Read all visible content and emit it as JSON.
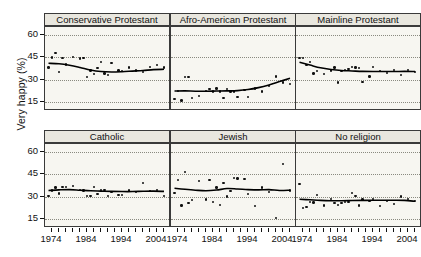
{
  "chart_data": {
    "type": "scatter",
    "title": "",
    "xlabel": "",
    "ylabel": "Very happy (%)",
    "xlim": [
      1972,
      2008
    ],
    "ylim": [
      9,
      65
    ],
    "yticks": [
      60,
      45,
      30,
      15
    ],
    "xticks_labeled": [
      1974,
      1984,
      1994,
      2004
    ],
    "xtick_step": 2,
    "grid": "horizontal dotted at y ticks",
    "legend": "none",
    "layout": {
      "rows": 2,
      "cols": 3,
      "strip_position": "top"
    },
    "panels": [
      {
        "label": "Conservative Protestant",
        "row": 0,
        "col": 0,
        "x": [
          1973,
          1974,
          1975,
          1976,
          1977,
          1978,
          1980,
          1982,
          1983,
          1984,
          1985,
          1986,
          1987,
          1988,
          1989,
          1990,
          1991,
          1993,
          1994,
          1996,
          1998,
          2000,
          2002,
          2004,
          2006
        ],
        "y": [
          38.0,
          44.8,
          47.5,
          35.0,
          44.2,
          40.0,
          45.0,
          44.0,
          44.5,
          31.5,
          36.0,
          33.5,
          37.5,
          41.5,
          34.0,
          33.0,
          41.0,
          36.0,
          35.5,
          38.0,
          36.0,
          35.0,
          38.5,
          39.5,
          38.0
        ],
        "smooth": [
          [
            1973,
            40.8
          ],
          [
            1976,
            40.5
          ],
          [
            1979,
            39.5
          ],
          [
            1982,
            38.0
          ],
          [
            1985,
            36.3
          ],
          [
            1988,
            35.3
          ],
          [
            1991,
            35.0
          ],
          [
            1994,
            35.2
          ],
          [
            1997,
            35.6
          ],
          [
            2000,
            36.0
          ],
          [
            2003,
            36.6
          ],
          [
            2006,
            36.8
          ]
        ]
      },
      {
        "label": "Afro-American Protestant",
        "row": 0,
        "col": 1,
        "x": [
          1973,
          1974,
          1975,
          1976,
          1977,
          1978,
          1980,
          1982,
          1983,
          1984,
          1985,
          1986,
          1987,
          1988,
          1989,
          1990,
          1991,
          1993,
          1994,
          1996,
          1998,
          2000,
          2002,
          2004,
          2006
        ],
        "y": [
          17.0,
          22.5,
          16.0,
          31.5,
          31.5,
          17.5,
          19.0,
          22.5,
          23.5,
          22.0,
          24.0,
          22.0,
          17.5,
          23.5,
          22.0,
          22.0,
          18.5,
          23.0,
          18.5,
          24.0,
          22.0,
          25.5,
          32.0,
          28.0,
          27.0
        ],
        "smooth": [
          [
            1973,
            22.3
          ],
          [
            1976,
            22.4
          ],
          [
            1979,
            22.2
          ],
          [
            1982,
            22.2
          ],
          [
            1985,
            22.3
          ],
          [
            1988,
            22.4
          ],
          [
            1991,
            22.6
          ],
          [
            1994,
            23.3
          ],
          [
            1997,
            24.6
          ],
          [
            2000,
            26.4
          ],
          [
            2003,
            28.6
          ],
          [
            2006,
            30.8
          ]
        ]
      },
      {
        "label": "Mainline Protestant",
        "row": 0,
        "col": 2,
        "x": [
          1973,
          1974,
          1975,
          1976,
          1977,
          1978,
          1980,
          1982,
          1983,
          1984,
          1985,
          1986,
          1987,
          1988,
          1989,
          1990,
          1991,
          1993,
          1994,
          1996,
          1998,
          2000,
          2002,
          2004,
          2006
        ],
        "y": [
          44.5,
          44.5,
          39.5,
          41.5,
          34.0,
          35.5,
          33.5,
          36.0,
          38.0,
          28.0,
          35.5,
          36.5,
          37.0,
          38.5,
          38.0,
          37.5,
          28.5,
          32.0,
          38.5,
          35.5,
          34.5,
          36.5,
          33.0,
          36.5,
          35.0
        ],
        "smooth": [
          [
            1973,
            41.5
          ],
          [
            1976,
            39.6
          ],
          [
            1979,
            37.8
          ],
          [
            1982,
            36.7
          ],
          [
            1985,
            36.0
          ],
          [
            1988,
            35.7
          ],
          [
            1991,
            35.4
          ],
          [
            1994,
            35.3
          ],
          [
            1997,
            35.3
          ],
          [
            2000,
            35.3
          ],
          [
            2003,
            35.4
          ],
          [
            2006,
            35.3
          ]
        ]
      },
      {
        "label": "Catholic",
        "row": 1,
        "col": 0,
        "x": [
          1973,
          1974,
          1975,
          1976,
          1977,
          1978,
          1980,
          1982,
          1983,
          1984,
          1985,
          1986,
          1987,
          1988,
          1989,
          1990,
          1991,
          1993,
          1994,
          1996,
          1998,
          2000,
          2002,
          2004,
          2006
        ],
        "y": [
          30.5,
          34.0,
          36.0,
          32.0,
          36.5,
          36.5,
          37.0,
          34.5,
          34.0,
          30.5,
          30.5,
          36.5,
          31.5,
          34.5,
          34.5,
          30.5,
          33.0,
          31.0,
          31.0,
          34.0,
          33.0,
          39.0,
          33.5,
          34.5,
          30.5
        ],
        "smooth": [
          [
            1973,
            34.0
          ],
          [
            1976,
            34.4
          ],
          [
            1979,
            34.6
          ],
          [
            1982,
            34.2
          ],
          [
            1985,
            33.8
          ],
          [
            1988,
            33.6
          ],
          [
            1991,
            33.4
          ],
          [
            1994,
            33.3
          ],
          [
            1997,
            33.3
          ],
          [
            2000,
            33.5
          ],
          [
            2003,
            33.6
          ],
          [
            2006,
            33.4
          ]
        ]
      },
      {
        "label": "Jewish",
        "row": 1,
        "col": 1,
        "x": [
          1973,
          1974,
          1975,
          1976,
          1977,
          1978,
          1980,
          1982,
          1983,
          1984,
          1985,
          1986,
          1987,
          1988,
          1989,
          1990,
          1991,
          1993,
          1994,
          1996,
          1998,
          2000,
          2002,
          2004,
          2006
        ],
        "y": [
          32.5,
          41.0,
          24.0,
          46.5,
          25.5,
          27.5,
          40.5,
          28.0,
          41.0,
          26.5,
          36.0,
          24.5,
          39.0,
          30.0,
          33.5,
          42.5,
          42.0,
          41.5,
          31.5,
          23.5,
          36.0,
          33.0,
          15.5,
          51.5,
          34.0
        ],
        "smooth": [
          [
            1973,
            35.5
          ],
          [
            1976,
            34.8
          ],
          [
            1979,
            34.2
          ],
          [
            1982,
            33.8
          ],
          [
            1985,
            34.3
          ],
          [
            1988,
            35.3
          ],
          [
            1991,
            35.0
          ],
          [
            1994,
            34.6
          ],
          [
            1997,
            34.4
          ],
          [
            2000,
            34.6
          ],
          [
            2003,
            34.0
          ],
          [
            2006,
            34.2
          ]
        ]
      },
      {
        "label": "No religion",
        "row": 1,
        "col": 2,
        "x": [
          1973,
          1974,
          1975,
          1976,
          1977,
          1978,
          1980,
          1982,
          1983,
          1984,
          1985,
          1986,
          1987,
          1988,
          1989,
          1990,
          1991,
          1993,
          1994,
          1996,
          1998,
          2000,
          2002,
          2004,
          2006
        ],
        "y": [
          38.5,
          22.5,
          23.0,
          26.5,
          26.0,
          31.0,
          24.0,
          28.5,
          25.5,
          24.5,
          25.5,
          26.5,
          26.5,
          32.5,
          30.5,
          24.0,
          28.0,
          27.0,
          28.5,
          23.5,
          27.0,
          25.0,
          30.0,
          28.5,
          27.0
        ],
        "smooth": [
          [
            1973,
            28.2
          ],
          [
            1976,
            27.8
          ],
          [
            1979,
            27.4
          ],
          [
            1982,
            27.2
          ],
          [
            1985,
            27.2
          ],
          [
            1988,
            27.3
          ],
          [
            1991,
            27.4
          ],
          [
            1994,
            27.5
          ],
          [
            1997,
            27.5
          ],
          [
            2000,
            27.5
          ],
          [
            2003,
            27.4
          ],
          [
            2006,
            26.8
          ]
        ]
      }
    ]
  }
}
